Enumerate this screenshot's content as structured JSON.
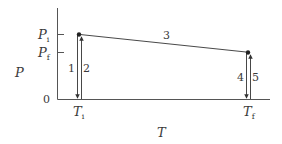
{
  "diagram": {
    "axes": {
      "x_label": "T",
      "y_label": "P",
      "origin_label": "0",
      "y_ticks": [
        {
          "label_main": "P",
          "label_sub": "i",
          "name": "P_i"
        },
        {
          "label_main": "P",
          "label_sub": "f",
          "name": "P_f"
        }
      ],
      "x_ticks": [
        {
          "label_main": "T",
          "label_sub": "i",
          "name": "T_i"
        },
        {
          "label_main": "T",
          "label_sub": "f",
          "name": "T_f"
        }
      ]
    },
    "points": [
      {
        "name": "initial",
        "T": "T_i",
        "P": "P_i"
      },
      {
        "name": "final",
        "T": "T_f",
        "P": "P_f"
      }
    ],
    "paths": [
      {
        "label": "1",
        "from": "(T_i, P_i)",
        "to": "(T_i, 0)",
        "direction": "down"
      },
      {
        "label": "2",
        "from": "(T_i, 0)",
        "to": "(T_i, P_i)",
        "direction": "up"
      },
      {
        "label": "3",
        "from": "(T_i, P_i)",
        "to": "(T_f, P_f)",
        "direction": "diagonal"
      },
      {
        "label": "4",
        "from": "(T_f, P_f)",
        "to": "(T_f, 0)",
        "direction": "down"
      },
      {
        "label": "5",
        "from": "(T_f, 0)",
        "to": "(T_f, P_f)",
        "direction": "up"
      }
    ],
    "colors": {
      "axis": "#555555",
      "path": "#333333",
      "text": "#3a3a3a"
    }
  }
}
